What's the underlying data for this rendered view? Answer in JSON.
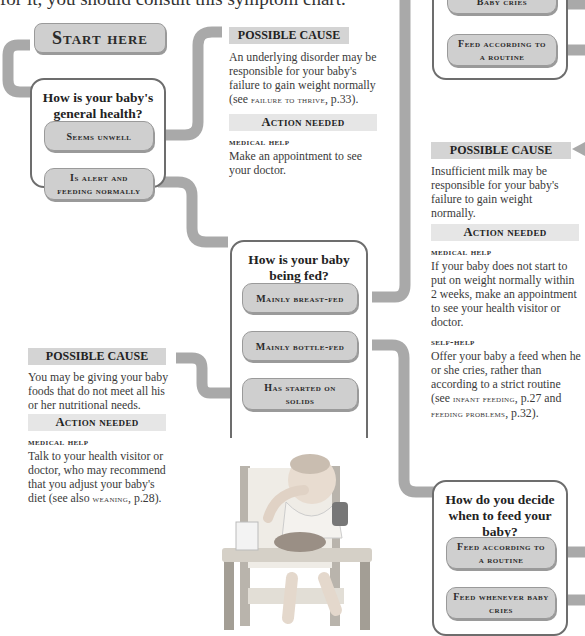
{
  "intro": {
    "text": "for it, you should consult this symptom chart."
  },
  "start": {
    "label": "Start here"
  },
  "q1": {
    "question": "How is your baby's general health?",
    "options": [
      "Seems unwell",
      "Is alert and feeding normally"
    ]
  },
  "q2": {
    "question": "How is your baby being fed?",
    "options": [
      "Mainly breast-fed",
      "Mainly bottle-fed",
      "Has started on solids"
    ]
  },
  "q3": {
    "question": "How do you decide when to feed your baby?",
    "options": [
      "Feed according to a routine",
      "Feed whenever baby cries"
    ]
  },
  "q_top_right": {
    "options": [
      "Baby cries",
      "Feed according to a routine"
    ]
  },
  "cause1": {
    "header": "POSSIBLE CAUSE",
    "text_pre": "An underlying disorder may be responsible for your baby's failure to gain weight normally (see ",
    "ref": "failure to thrive",
    "text_post": ", p.33).",
    "action_header": "Action needed",
    "action_sub": "medical help",
    "action_text": "Make an appointment to see your doctor."
  },
  "cause2": {
    "header": "POSSIBLE CAUSE",
    "text": "Insufficient milk may be responsible for your baby's failure to gain weight normally.",
    "action_header": "Action needed",
    "medical_sub": "medical help",
    "medical_text": "If your baby does not start to put on weight normally within 2 weeks, make an appointment to see your health visitor or doctor.",
    "self_sub": "self-help",
    "self_text_pre": "Offer your baby a feed when he or she cries, rather than according to a strict routine (see ",
    "ref1": "infant feeding",
    "mid": ", p.27 and ",
    "ref2": "feeding problems",
    "self_text_post": ", p.32)."
  },
  "cause3": {
    "header": "POSSIBLE CAUSE",
    "text": "You may be giving your baby foods that do not meet all his or her nutritional needs.",
    "action_header": "Action needed",
    "action_sub": "medical help",
    "action_text_pre": "Talk to your health visitor or doctor, who may recommend that you adjust your baby's diet (see also ",
    "ref": "weaning",
    "action_text_post": ", p.28)."
  },
  "photo": {
    "alt": "Baby sitting in high chair eating from bowl"
  },
  "colors": {
    "connector": "#a9a9a9",
    "option_fill": "#cfcfcf",
    "header_fill": "#d4d4d4",
    "border": "#6d6d6d"
  }
}
